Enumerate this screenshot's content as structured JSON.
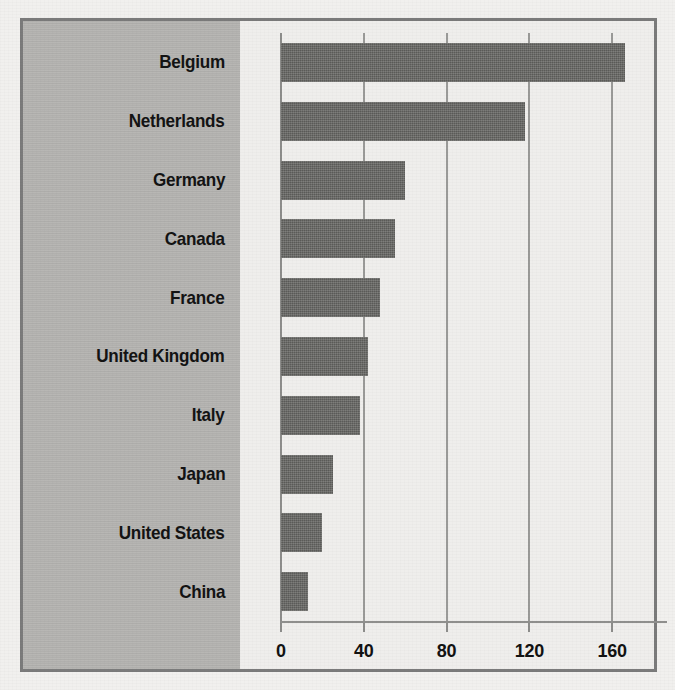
{
  "chart_data": {
    "type": "bar",
    "orientation": "horizontal",
    "title": "",
    "subtitle": "",
    "xlabel": "",
    "ylabel": "",
    "categories": [
      "Belgium",
      "Netherlands",
      "Germany",
      "Canada",
      "France",
      "United Kingdom",
      "Italy",
      "Japan",
      "United States",
      "China"
    ],
    "values": [
      166,
      118,
      60,
      55,
      48,
      42,
      38,
      25,
      20,
      13
    ],
    "xticks": [
      0,
      40,
      80,
      120,
      160
    ],
    "xtick_labels": [
      "0",
      "40",
      "80",
      "120",
      "160"
    ],
    "xlim": [
      0,
      180
    ],
    "grid": true,
    "legend": null,
    "annotations": []
  },
  "style": {
    "bar_color": "#666663",
    "panel_color": "#b4b3b0",
    "plot_background": "#efeeec",
    "frame_border_color": "#7b7b7b",
    "grid_color": "#9a9a98",
    "text_color": "#131313",
    "page_background": "#f1f0ee"
  }
}
